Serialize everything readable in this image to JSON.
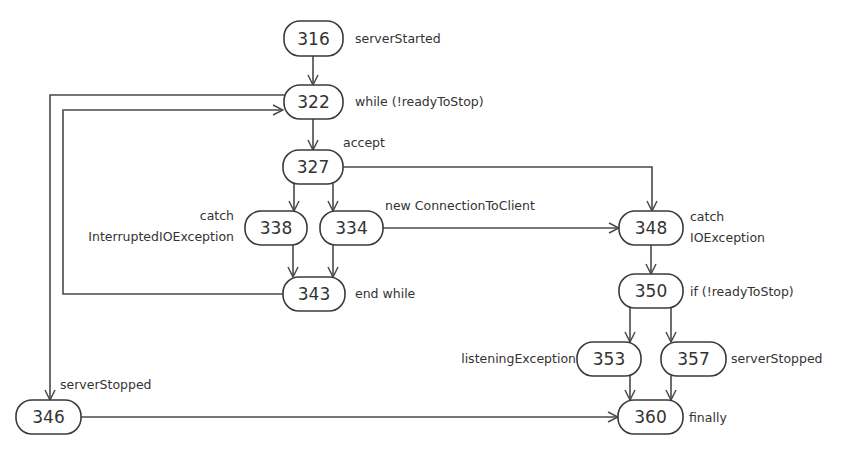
{
  "diagram": {
    "nodes": [
      {
        "id": "316",
        "label": "316",
        "annotation": "serverStarted"
      },
      {
        "id": "322",
        "label": "322",
        "annotation": "while (!readyToStop)"
      },
      {
        "id": "327",
        "label": "327",
        "annotation": "accept"
      },
      {
        "id": "338",
        "label": "338",
        "annotation_line1": "catch",
        "annotation_line2": "InterruptedIOException"
      },
      {
        "id": "334",
        "label": "334",
        "annotation": "new ConnectionToClient"
      },
      {
        "id": "343",
        "label": "343",
        "annotation": "end while"
      },
      {
        "id": "348",
        "label": "348",
        "annotation_line1": "catch",
        "annotation_line2": "IOException"
      },
      {
        "id": "350",
        "label": "350",
        "annotation": "if (!readyToStop)"
      },
      {
        "id": "353",
        "label": "353",
        "annotation": "listeningException"
      },
      {
        "id": "357",
        "label": "357",
        "annotation": "serverStopped"
      },
      {
        "id": "346",
        "label": "346",
        "annotation": "serverStopped"
      },
      {
        "id": "360",
        "label": "360",
        "annotation": "finally"
      }
    ],
    "edges": [
      {
        "from": "316",
        "to": "322"
      },
      {
        "from": "322",
        "to": "327"
      },
      {
        "from": "322",
        "to": "346"
      },
      {
        "from": "327",
        "to": "338"
      },
      {
        "from": "327",
        "to": "334"
      },
      {
        "from": "327",
        "to": "348"
      },
      {
        "from": "338",
        "to": "343"
      },
      {
        "from": "334",
        "to": "343"
      },
      {
        "from": "334",
        "to": "348"
      },
      {
        "from": "343",
        "to": "322"
      },
      {
        "from": "348",
        "to": "350"
      },
      {
        "from": "350",
        "to": "353"
      },
      {
        "from": "350",
        "to": "357"
      },
      {
        "from": "353",
        "to": "360"
      },
      {
        "from": "357",
        "to": "360"
      },
      {
        "from": "346",
        "to": "360"
      }
    ]
  }
}
